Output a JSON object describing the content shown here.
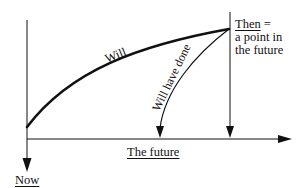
{
  "diagram": {
    "labels": {
      "now": "Now",
      "the_future": "The future",
      "then_line1": "Then",
      "then_eq": " =",
      "then_line2": "a point in",
      "then_line3": "the future",
      "will": "Will",
      "will_have_done": "Will have done"
    },
    "colors": {
      "ink": "#111111",
      "background": "#ffffff"
    }
  }
}
